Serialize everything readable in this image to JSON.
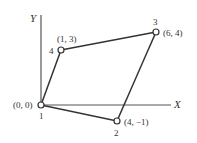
{
  "diagram": {
    "type": "quadrilateral-element-mapping",
    "axes": {
      "x_label": "X",
      "y_label": "Y"
    },
    "nodes": [
      {
        "id": "1",
        "number_label": "1",
        "coord_label": "(0, 0)",
        "x": 0,
        "y": 0
      },
      {
        "id": "2",
        "number_label": "2",
        "coord_label": "(4, −1)",
        "x": 4,
        "y": -1
      },
      {
        "id": "3",
        "number_label": "3",
        "coord_label": "(6, 4)",
        "x": 6,
        "y": 4
      },
      {
        "id": "4",
        "number_label": "4",
        "coord_label": "(1, 3)",
        "x": 1,
        "y": 3
      }
    ],
    "edges": [
      [
        "1",
        "2"
      ],
      [
        "2",
        "3"
      ],
      [
        "3",
        "4"
      ],
      [
        "4",
        "1"
      ]
    ],
    "colors": {
      "line": "#333333",
      "axis": "#555555",
      "node_fill": "#ffffff"
    }
  }
}
